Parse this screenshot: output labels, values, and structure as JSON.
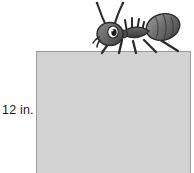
{
  "figure": {
    "background_color": "#ffffff"
  },
  "rectangle": {
    "name": "gray-rectangle",
    "fill_color": "#d2d2d2",
    "border_color": "#9a9a9a"
  },
  "labels": {
    "height": "12 in."
  },
  "ant": {
    "name": "ant-illustration",
    "body_color": "#6e6e6e",
    "outline_color": "#2b2b2b",
    "eye_color": "#ffffff",
    "pupil_color": "#1a1a1a"
  }
}
